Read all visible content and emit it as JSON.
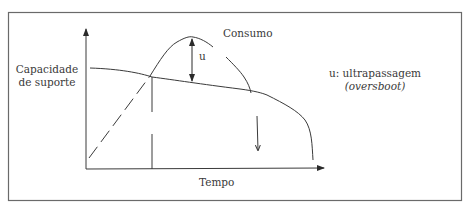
{
  "diagram": {
    "type": "conceptual-curve",
    "labels": {
      "y_axis_line1": "Capacidade",
      "y_axis_line2": "de suporte",
      "consumption": "Consumo",
      "overshoot_marker": "u",
      "legend_line1": "u: ultrapassagem",
      "legend_line2": "(oversboot)",
      "x_axis": "Tempo"
    },
    "curves": [
      {
        "name": "Capacidade de suporte",
        "description": "slowly declining line that collapses steeply at the end"
      },
      {
        "name": "Consumo",
        "description": "rising (dashed at start) curve that peaks above capacity, then falls"
      }
    ],
    "annotations": [
      {
        "name": "u",
        "description": "double-headed arrow between consumption peak and capacity line"
      },
      {
        "name": "decline-arrow",
        "description": "downward arrow indicating collapse"
      }
    ],
    "colors": {
      "line": "#3a3a3a",
      "frame": "#6a6a6a",
      "background": "#ffffff"
    }
  }
}
